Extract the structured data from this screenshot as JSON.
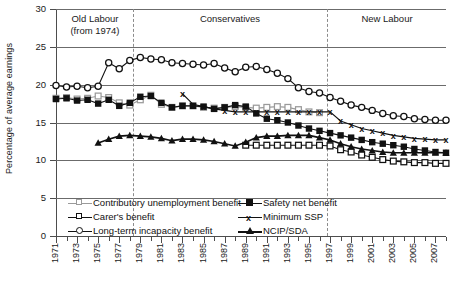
{
  "chart_data": {
    "type": "line",
    "title": "",
    "xlabel": "",
    "ylabel": "Percentage of average earnings",
    "ylim": [
      0,
      30
    ],
    "yticks": [
      0,
      5,
      10,
      15,
      20,
      25,
      30
    ],
    "xlim": [
      1971,
      2008
    ],
    "xticks": [
      1971,
      1973,
      1975,
      1977,
      1979,
      1981,
      1983,
      1985,
      1987,
      1989,
      1991,
      1993,
      1995,
      1997,
      1999,
      2001,
      2003,
      2005,
      2007
    ],
    "grid": true,
    "legend_position": "inside-bottom-left",
    "x": [
      1971,
      1972,
      1973,
      1974,
      1975,
      1976,
      1977,
      1978,
      1979,
      1980,
      1981,
      1982,
      1983,
      1984,
      1985,
      1986,
      1987,
      1988,
      1989,
      1990,
      1991,
      1992,
      1993,
      1994,
      1995,
      1996,
      1997,
      1998,
      1999,
      2000,
      2001,
      2002,
      2003,
      2004,
      2005,
      2006,
      2007,
      2008
    ],
    "series": [
      {
        "name": "Contributory unemployment benefit",
        "marker": "square-open-grey",
        "color": "#9a9a9a",
        "values": [
          18.2,
          18.3,
          18.1,
          18.2,
          18.5,
          18.3,
          17.6,
          17.3,
          18.0,
          18.6,
          17.4,
          17.0,
          17.2,
          17.2,
          17.0,
          16.9,
          17.0,
          17.1,
          17.0,
          16.9,
          17.0,
          17.1,
          17.0,
          16.7,
          16.4,
          16.3,
          null,
          null,
          null,
          null,
          null,
          null,
          null,
          null,
          null,
          null,
          null,
          null
        ]
      },
      {
        "name": "Carer's benefit",
        "marker": "square-open",
        "color": "#111111",
        "values": [
          null,
          null,
          null,
          null,
          null,
          null,
          null,
          null,
          null,
          null,
          null,
          null,
          null,
          null,
          null,
          null,
          null,
          null,
          12.0,
          12.0,
          12.0,
          12.0,
          12.0,
          12.0,
          12.0,
          12.0,
          11.9,
          11.4,
          11.1,
          10.7,
          10.4,
          10.1,
          9.9,
          9.8,
          9.7,
          9.7,
          9.6,
          9.6
        ]
      },
      {
        "name": "Long-term incapacity benefit",
        "marker": "circle-open",
        "color": "#111111",
        "values": [
          19.9,
          19.7,
          19.8,
          19.6,
          19.8,
          22.9,
          22.1,
          23.2,
          23.6,
          23.4,
          23.3,
          22.9,
          22.8,
          22.7,
          22.6,
          22.8,
          22.2,
          21.7,
          22.3,
          22.4,
          22.0,
          21.5,
          20.8,
          19.6,
          19.1,
          18.9,
          18.3,
          17.8,
          17.3,
          17.0,
          16.6,
          16.2,
          15.9,
          15.8,
          15.5,
          15.4,
          15.3,
          15.3
        ]
      },
      {
        "name": "Safety net benefit",
        "marker": "square-filled",
        "color": "#111111",
        "values": [
          18.1,
          18.2,
          17.9,
          18.0,
          17.5,
          18.0,
          17.2,
          17.6,
          18.4,
          18.5,
          17.6,
          17.0,
          17.2,
          17.2,
          17.1,
          16.8,
          17.0,
          17.3,
          17.1,
          16.2,
          15.5,
          15.3,
          15.0,
          14.6,
          14.2,
          13.9,
          13.6,
          13.3,
          13.0,
          12.7,
          12.4,
          12.2,
          12.0,
          11.8,
          11.5,
          11.3,
          11.1,
          11.0
        ]
      },
      {
        "name": "Minimum SSP",
        "marker": "x",
        "color": "#111111",
        "values": [
          null,
          null,
          null,
          null,
          null,
          null,
          null,
          null,
          null,
          null,
          null,
          null,
          18.8,
          17.4,
          17.1,
          16.8,
          16.6,
          16.4,
          16.4,
          16.4,
          16.4,
          16.4,
          16.4,
          16.4,
          16.4,
          16.4,
          16.4,
          15.2,
          14.7,
          14.2,
          13.9,
          13.6,
          13.3,
          13.1,
          12.9,
          12.8,
          12.7,
          12.7
        ]
      },
      {
        "name": "NCIP/SDA",
        "marker": "triangle-filled",
        "color": "#111111",
        "values": [
          null,
          null,
          null,
          null,
          12.3,
          12.8,
          13.2,
          13.3,
          13.2,
          13.1,
          12.9,
          12.6,
          12.8,
          12.8,
          12.7,
          12.5,
          12.2,
          11.9,
          12.4,
          13.0,
          13.2,
          13.2,
          13.3,
          13.3,
          13.3,
          13.0,
          12.7,
          12.2,
          11.8,
          11.5,
          11.3,
          11.1,
          11.0,
          11.0,
          11.0,
          11.0,
          11.0,
          11.0
        ]
      }
    ],
    "annotations": [
      {
        "name": "era-old-labour",
        "text": "Old Labour\n(from 1974)",
        "x_start": 1971,
        "x_end": 1979
      },
      {
        "name": "era-conservatives",
        "text": "Conservatives",
        "x_start": 1979,
        "x_end": 1997
      },
      {
        "name": "era-new-labour",
        "text": "New Labour",
        "x_start": 1997,
        "x_end": 2008
      }
    ],
    "dividers": [
      1979,
      1997
    ]
  },
  "axis": {
    "ylabel": "Percentage of average earnings",
    "ytick_labels": [
      "30",
      "25",
      "20",
      "15",
      "10",
      "5",
      "0"
    ],
    "xtick_labels": [
      "1971",
      "1973",
      "1975",
      "1977",
      "1979",
      "1981",
      "1983",
      "1985",
      "1987",
      "1989",
      "1991",
      "1993",
      "1995",
      "1997",
      "1999",
      "2001",
      "2003",
      "2005",
      "2007"
    ]
  },
  "eras": {
    "old_labour": "Old Labour\n(from 1974)",
    "conservatives": "Conservatives",
    "new_labour": "New Labour"
  },
  "legend": {
    "items": [
      {
        "label": "Contributory unemployment benefit"
      },
      {
        "label": "Carer's benefit"
      },
      {
        "label": "Long-term incapacity benefit"
      },
      {
        "label": "Safety net benefit"
      },
      {
        "label": "Minimum SSP"
      },
      {
        "label": "NCIP/SDA"
      }
    ]
  },
  "colors": {
    "ink": "#111111",
    "grey_series": "#9a9a9a",
    "gridline": "#6b6b6b",
    "divider": "#8c8c8c"
  }
}
